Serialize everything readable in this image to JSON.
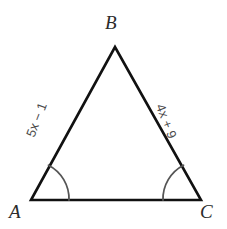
{
  "figure": {
    "type": "triangle-diagram",
    "background_color": "#ffffff",
    "stroke_color": "#111111",
    "arc_color": "#555555",
    "vertices": {
      "A": {
        "label": "A",
        "x": 31,
        "y": 200
      },
      "B": {
        "label": "B",
        "x": 115,
        "y": 47
      },
      "C": {
        "label": "C",
        "x": 201,
        "y": 200
      }
    },
    "sides": [
      {
        "name": "AB",
        "label": "5x − 1",
        "from": "A",
        "to": "B"
      },
      {
        "name": "BC",
        "label": "4x + 9",
        "from": "B",
        "to": "C"
      },
      {
        "name": "AC",
        "label": "",
        "from": "A",
        "to": "C"
      }
    ],
    "angle_marks": [
      {
        "at": "A",
        "arcs": 1,
        "radius": 38
      },
      {
        "at": "C",
        "arcs": 1,
        "radius": 38
      }
    ]
  }
}
